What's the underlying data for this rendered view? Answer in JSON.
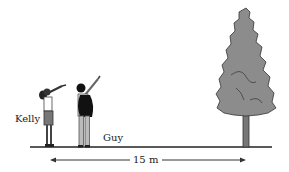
{
  "diagram": {
    "people": [
      {
        "name": "Kelly",
        "label": "Kelly"
      },
      {
        "name": "Guy",
        "label": "Guy"
      }
    ],
    "object": "tree",
    "distance_label": "15 m",
    "colors": {
      "tree_fill": "#8c8c8c",
      "outline": "#333333",
      "ground": "#222222"
    }
  }
}
